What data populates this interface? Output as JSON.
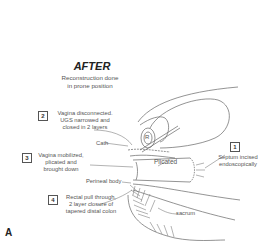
{
  "figure": {
    "title": "AFTER",
    "subtitle_line1": "Reconstruction done",
    "subtitle_line2": "in prone position",
    "panel_label": "A"
  },
  "steps": [
    {
      "number": "1",
      "lines": [
        "Septum incised",
        "endoscopically"
      ]
    },
    {
      "number": "2",
      "lines": [
        "Vagina disconnected.",
        "UGS narrowed and",
        "closed in 2 layers"
      ]
    },
    {
      "number": "3",
      "lines": [
        "Vagina mobilized,",
        "plicated and",
        "brought down"
      ]
    },
    {
      "number": "4",
      "lines": [
        "Rectal pull through,",
        "2 layer closure of",
        "tapered distal colon"
      ]
    }
  ],
  "anatomy_labels": {
    "cath": "Cath",
    "perineal_body": "Perineal body",
    "plicated": "Plicated",
    "sacrum": "sacrum",
    "bladder_mark": "R"
  },
  "colors": {
    "line": "#666666",
    "text": "#555555",
    "background": "#ffffff"
  }
}
